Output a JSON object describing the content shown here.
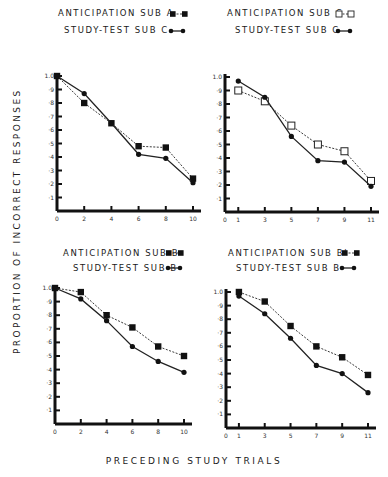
{
  "ylabel": "PROPORTION OF INCORRECT RESPONSES",
  "xlabel": "PRECEDING STUDY TRIALS",
  "legends": {
    "tl_1": "ANTICIPATION SUB A",
    "tl_2": "STUDY-TEST SUB C",
    "tr_1": "ANTICIPATION SUB C",
    "tr_2": "STUDY-TEST SUB C",
    "bl_1": "ANTICIPATION SUB B",
    "bl_2": "STUDY-TEST SUB B",
    "br_1": "ANTICIPATION SUB B'",
    "br_2": "STUDY-TEST SUB B"
  },
  "chart_data": [
    {
      "type": "line",
      "position": "top-left",
      "xlabel": "Preceding Study Trials",
      "ylabel": "Proportion of Incorrect Responses",
      "x_ticks": [
        0,
        2,
        4,
        6,
        8,
        10
      ],
      "y_ticks": [
        0,
        0.1,
        0.2,
        0.3,
        0.4,
        0.5,
        0.6,
        0.7,
        0.8,
        0.9,
        1.0
      ],
      "xlim": [
        0,
        10.5
      ],
      "ylim": [
        0,
        1.0
      ],
      "x": [
        0,
        2,
        4,
        6,
        8,
        10
      ],
      "series": [
        {
          "name": "Anticipation Sub A",
          "marker": "filled-square",
          "line": "dashed",
          "values": [
            1.0,
            0.8,
            0.65,
            0.48,
            0.47,
            0.24
          ]
        },
        {
          "name": "Study-Test Sub C",
          "marker": "filled-circle",
          "line": "solid",
          "values": [
            1.0,
            0.87,
            0.65,
            0.42,
            0.39,
            0.21
          ]
        }
      ]
    },
    {
      "type": "line",
      "position": "top-right",
      "x_ticks": [
        0,
        1,
        3,
        5,
        7,
        9,
        11
      ],
      "y_ticks": [
        0,
        0.1,
        0.2,
        0.3,
        0.4,
        0.5,
        0.6,
        0.7,
        0.8,
        0.9,
        1.0
      ],
      "xlim": [
        0,
        11
      ],
      "ylim": [
        0,
        1.0
      ],
      "x": [
        1,
        3,
        5,
        7,
        9,
        11
      ],
      "series": [
        {
          "name": "Anticipation Sub C",
          "marker": "open-square",
          "line": "dashed",
          "values": [
            0.9,
            0.82,
            0.64,
            0.5,
            0.45,
            0.23
          ]
        },
        {
          "name": "Study-Test Sub C",
          "marker": "filled-circle",
          "line": "solid",
          "values": [
            0.97,
            0.85,
            0.56,
            0.38,
            0.37,
            0.19
          ]
        }
      ]
    },
    {
      "type": "line",
      "position": "bottom-left",
      "x_ticks": [
        0,
        2,
        4,
        6,
        8,
        10
      ],
      "y_ticks": [
        0,
        0.1,
        0.2,
        0.3,
        0.4,
        0.5,
        0.6,
        0.7,
        0.8,
        0.9,
        1.0
      ],
      "xlim": [
        0,
        10.5
      ],
      "ylim": [
        0,
        1.0
      ],
      "x": [
        0,
        2,
        4,
        6,
        8,
        10
      ],
      "series": [
        {
          "name": "Anticipation Sub B",
          "marker": "filled-square",
          "line": "dashed",
          "values": [
            1.0,
            0.97,
            0.8,
            0.71,
            0.57,
            0.5
          ]
        },
        {
          "name": "Study-Test Sub B",
          "marker": "filled-circle",
          "line": "solid",
          "values": [
            1.0,
            0.92,
            0.76,
            0.57,
            0.46,
            0.38
          ]
        }
      ]
    },
    {
      "type": "line",
      "position": "bottom-right",
      "x_ticks": [
        0,
        1,
        3,
        5,
        7,
        9,
        11
      ],
      "y_ticks": [
        0,
        0.1,
        0.2,
        0.3,
        0.4,
        0.5,
        0.6,
        0.7,
        0.8,
        0.9,
        1.0
      ],
      "xlim": [
        0,
        11
      ],
      "ylim": [
        0,
        1.0
      ],
      "x": [
        1,
        3,
        5,
        7,
        9,
        11
      ],
      "series": [
        {
          "name": "Anticipation Sub B'",
          "marker": "filled-square",
          "line": "dashed",
          "values": [
            1.0,
            0.93,
            0.75,
            0.6,
            0.52,
            0.39
          ]
        },
        {
          "name": "Study-Test Sub B",
          "marker": "filled-circle",
          "line": "solid",
          "values": [
            0.97,
            0.84,
            0.66,
            0.46,
            0.4,
            0.26
          ]
        }
      ]
    }
  ]
}
